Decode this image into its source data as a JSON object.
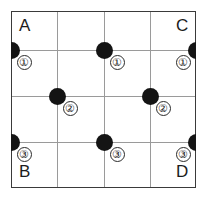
{
  "figure": {
    "kind": "grid-network-diagram",
    "width": 208,
    "height": 198,
    "background_color": "#ffffff",
    "frame": {
      "border_color": "#3a3a3a",
      "gridline_color": "#9a9a9a",
      "columns": 4,
      "rows": 4
    }
  },
  "corner_labels": [
    {
      "text": "A",
      "position": "top-left",
      "x": 19,
      "y": 17
    },
    {
      "text": "C",
      "position": "top-right",
      "x": 176,
      "y": 17
    },
    {
      "text": "B",
      "position": "bottom-left",
      "x": 19,
      "y": 163
    },
    {
      "text": "D",
      "position": "bottom-right",
      "x": 176,
      "y": 163
    }
  ],
  "grid": {
    "x_positions": [
      11,
      57,
      104,
      150,
      196
    ],
    "y_positions": [
      11,
      50,
      96,
      142,
      188
    ]
  },
  "nodes": [
    {
      "label": "①",
      "dot_x": 11,
      "dot_y": 50,
      "label_x": 24,
      "label_y": 62,
      "color": "#141414"
    },
    {
      "label": "①",
      "dot_x": 104,
      "dot_y": 50,
      "label_x": 117,
      "label_y": 62,
      "color": "#141414"
    },
    {
      "label": "①",
      "dot_x": 196,
      "dot_y": 50,
      "label_x": 183,
      "label_y": 62,
      "color": "#141414"
    },
    {
      "label": "②",
      "dot_x": 57,
      "dot_y": 96,
      "label_x": 70,
      "label_y": 108,
      "color": "#141414"
    },
    {
      "label": "②",
      "dot_x": 150,
      "dot_y": 96,
      "label_x": 163,
      "label_y": 108,
      "color": "#141414"
    },
    {
      "label": "③",
      "dot_x": 11,
      "dot_y": 142,
      "label_x": 24,
      "label_y": 154,
      "color": "#141414"
    },
    {
      "label": "③",
      "dot_x": 104,
      "dot_y": 142,
      "label_x": 117,
      "label_y": 154,
      "color": "#141414"
    },
    {
      "label": "③",
      "dot_x": 196,
      "dot_y": 142,
      "label_x": 183,
      "label_y": 154,
      "color": "#141414"
    }
  ]
}
